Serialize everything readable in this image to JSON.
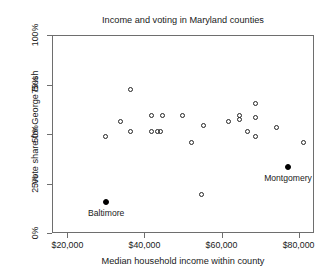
{
  "chart_data": {
    "type": "scatter",
    "title": "Income and voting in Maryland counties",
    "xlabel": "Median household income within county",
    "ylabel": "Vote share for George Bush",
    "xlim": [
      16000,
      84000
    ],
    "ylim": [
      0,
      100
    ],
    "grid": false,
    "legend": null,
    "xticks": [
      {
        "value": 20000,
        "label": "$20,000"
      },
      {
        "value": 40000,
        "label": "$40,000"
      },
      {
        "value": 60000,
        "label": "$60,000"
      },
      {
        "value": 80000,
        "label": "$80,000"
      }
    ],
    "yticks": [
      {
        "value": 0,
        "label": "0%"
      },
      {
        "value": 25,
        "label": "25%"
      },
      {
        "value": 50,
        "label": "50%"
      },
      {
        "value": 75,
        "label": "75%"
      },
      {
        "value": 100,
        "label": "100%"
      }
    ],
    "series": [
      {
        "name": "Maryland counties",
        "marker": "open-circle",
        "points": [
          {
            "x": 29500,
            "y": 49
          },
          {
            "x": 33500,
            "y": 57
          },
          {
            "x": 36000,
            "y": 52
          },
          {
            "x": 36000,
            "y": 73
          },
          {
            "x": 41500,
            "y": 60
          },
          {
            "x": 41500,
            "y": 52
          },
          {
            "x": 43000,
            "y": 52
          },
          {
            "x": 43800,
            "y": 52
          },
          {
            "x": 44500,
            "y": 60
          },
          {
            "x": 49500,
            "y": 60
          },
          {
            "x": 52000,
            "y": 46
          },
          {
            "x": 54500,
            "y": 20
          },
          {
            "x": 55000,
            "y": 55
          },
          {
            "x": 61500,
            "y": 57
          },
          {
            "x": 64500,
            "y": 60
          },
          {
            "x": 64500,
            "y": 58
          },
          {
            "x": 66500,
            "y": 52
          },
          {
            "x": 68500,
            "y": 66
          },
          {
            "x": 68500,
            "y": 59
          },
          {
            "x": 68500,
            "y": 49
          },
          {
            "x": 74000,
            "y": 54
          },
          {
            "x": 81000,
            "y": 46
          }
        ]
      },
      {
        "name": "Highlighted counties",
        "marker": "filled-circle",
        "points": [
          {
            "x": 29800,
            "y": 16,
            "label": "Baltimore",
            "label_position": "below"
          },
          {
            "x": 77000,
            "y": 34,
            "label": "Montgomery",
            "label_position": "below"
          }
        ]
      }
    ]
  }
}
